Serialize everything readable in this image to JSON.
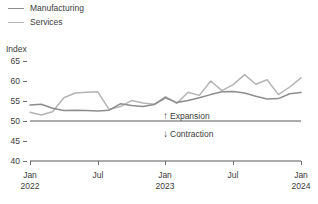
{
  "legend": {
    "items": [
      {
        "label": "Manufacturing",
        "color": "#8d8d8d"
      },
      {
        "label": "Services",
        "color": "#b4b4b4"
      }
    ]
  },
  "axis": {
    "y_title": "Index",
    "y_ticks": [
      "65",
      "60",
      "55",
      "50",
      "45",
      "40"
    ],
    "x_ticks": [
      {
        "month": "Jan",
        "year": "2022"
      },
      {
        "month": "Jul",
        "year": ""
      },
      {
        "month": "Jan",
        "year": "2023"
      },
      {
        "month": "Jul",
        "year": ""
      },
      {
        "month": "Jan",
        "year": "2024"
      }
    ]
  },
  "annotations": {
    "expansion": {
      "arrow": "↑",
      "label": "Expansion"
    },
    "contraction": {
      "arrow": "↓",
      "label": "Contraction"
    }
  },
  "chart_data": {
    "type": "line",
    "title": "",
    "xlabel": "",
    "ylabel": "Index",
    "ylim": [
      40,
      65
    ],
    "yticks": [
      40,
      45,
      50,
      55,
      60,
      65
    ],
    "grid": false,
    "legend_position": "top-left",
    "reference_line": {
      "value": 50,
      "label": "50 = no change"
    },
    "annotations": [
      {
        "text": "↑ Expansion",
        "x": "2023-01",
        "y": 52.5
      },
      {
        "text": "↓ Contraction",
        "x": "2023-01",
        "y": 47.5
      }
    ],
    "x": [
      "2022-01",
      "2022-02",
      "2022-03",
      "2022-04",
      "2022-05",
      "2022-06",
      "2022-07",
      "2022-08",
      "2022-09",
      "2022-10",
      "2022-11",
      "2022-12",
      "2023-01",
      "2023-02",
      "2023-03",
      "2023-04",
      "2023-05",
      "2023-06",
      "2023-07",
      "2023-08",
      "2023-09",
      "2023-10",
      "2023-11",
      "2023-12",
      "2024-01"
    ],
    "x_tick_labels": [
      "Jan 2022",
      "Jul",
      "Jan 2023",
      "Jul",
      "Jan 2024"
    ],
    "series": [
      {
        "name": "Manufacturing",
        "color": "#8d8d8d",
        "values": [
          54.0,
          54.2,
          53.2,
          52.6,
          52.7,
          52.6,
          52.5,
          52.7,
          54.3,
          53.9,
          53.6,
          54.1,
          55.8,
          54.6,
          55.1,
          55.8,
          56.6,
          57.3,
          57.4,
          57.0,
          56.2,
          55.5,
          55.6,
          56.8,
          57.1
        ]
      },
      {
        "name": "Services",
        "color": "#b4b4b4",
        "values": [
          52.2,
          51.5,
          52.3,
          55.8,
          57.0,
          57.2,
          57.3,
          52.9,
          53.6,
          55.1,
          54.5,
          54.2,
          56.1,
          54.4,
          57.2,
          56.4,
          60.0,
          57.6,
          59.1,
          61.6,
          59.2,
          60.3,
          56.6,
          58.5,
          60.8
        ]
      }
    ]
  }
}
